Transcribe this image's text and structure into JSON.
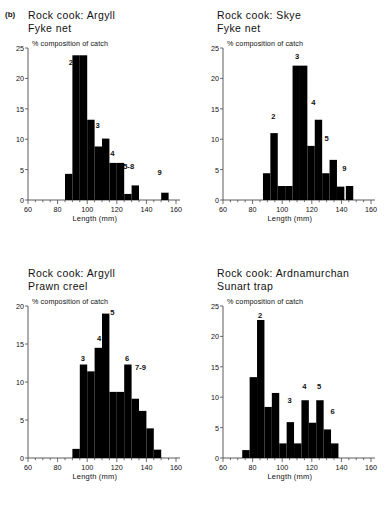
{
  "figure": {
    "panel_tag": "(b)",
    "background": "#ffffff",
    "bar_color": "#000000",
    "axis_color": "#4a4a4a"
  },
  "axis_titles": {
    "y": "% composition of catch",
    "x": "Length (mm)"
  },
  "chart_data": [
    {
      "id": "argyll-fyke-net",
      "type": "bar",
      "title": "Rock cook: Argyll\nFyke net",
      "xlabel": "Length (mm)",
      "ylabel": "% composition of catch",
      "xlim": [
        60,
        160
      ],
      "ylim": [
        0,
        25
      ],
      "xticks": [
        60,
        80,
        100,
        120,
        140,
        160
      ],
      "yticks": [
        0,
        5,
        10,
        15,
        20,
        25
      ],
      "minor_xtick_step": 5,
      "bin_width": 5,
      "grid": false,
      "legend": "none",
      "bin_starts": [
        85,
        90,
        95,
        100,
        105,
        110,
        115,
        120,
        125,
        130,
        150
      ],
      "values": [
        4.3,
        23.8,
        23.8,
        13.2,
        8.8,
        10.1,
        6.1,
        6.1,
        1.0,
        2.4,
        1.2
      ],
      "annotations": [
        {
          "text": "2",
          "x": 89,
          "y": 22.6
        },
        {
          "text": "3",
          "x": 107,
          "y": 12.1
        },
        {
          "text": "4",
          "x": 117,
          "y": 7.6
        },
        {
          "text": "5-8",
          "x": 128,
          "y": 5.4
        },
        {
          "text": "9",
          "x": 149,
          "y": 4.4
        }
      ]
    },
    {
      "id": "skye-fyke-net",
      "type": "bar",
      "title": "Rock cook: Skye\nFyke net",
      "xlabel": "Length (mm)",
      "ylabel": "% composition of catch",
      "xlim": [
        60,
        160
      ],
      "ylim": [
        0,
        25
      ],
      "xticks": [
        60,
        80,
        100,
        120,
        140,
        160
      ],
      "yticks": [
        0,
        5,
        10,
        15,
        20,
        25
      ],
      "minor_xtick_step": 5,
      "bin_width": 5,
      "grid": false,
      "legend": "none",
      "bin_starts": [
        87,
        92,
        97,
        102,
        107,
        112,
        117,
        122,
        127,
        132,
        137,
        143
      ],
      "values": [
        4.4,
        11.0,
        2.3,
        2.3,
        22.1,
        22.1,
        8.9,
        13.2,
        4.4,
        6.6,
        2.2,
        2.3
      ],
      "annotations": [
        {
          "text": "3",
          "x": 110,
          "y": 23.6
        },
        {
          "text": "4",
          "x": 121,
          "y": 16.0
        },
        {
          "text": "2",
          "x": 94,
          "y": 13.6
        },
        {
          "text": "5",
          "x": 130,
          "y": 10.1
        },
        {
          "text": "9",
          "x": 142,
          "y": 5.1
        }
      ]
    },
    {
      "id": "argyll-prawn-creel",
      "type": "bar",
      "title": "Rock cook: Argyll\nPrawn creel",
      "xlabel": "Length (mm)",
      "ylabel": "% composition of catch",
      "xlim": [
        60,
        160
      ],
      "ylim": [
        0,
        20
      ],
      "xticks": [
        60,
        80,
        100,
        120,
        140,
        160
      ],
      "yticks": [
        0,
        5,
        10,
        15,
        20
      ],
      "minor_xtick_step": 5,
      "bin_width": 5,
      "grid": false,
      "legend": "none",
      "bin_starts": [
        90,
        95,
        100,
        105,
        110,
        115,
        120,
        125,
        130,
        135,
        140,
        145
      ],
      "values": [
        1.2,
        12.3,
        11.4,
        14.5,
        19.0,
        8.7,
        8.7,
        12.3,
        7.8,
        6.2,
        3.9,
        1.1
      ],
      "annotations": [
        {
          "text": "5",
          "x": 117,
          "y": 19.1
        },
        {
          "text": "4",
          "x": 108,
          "y": 15.7
        },
        {
          "text": "3",
          "x": 97,
          "y": 13.0
        },
        {
          "text": "6",
          "x": 127,
          "y": 13.0
        },
        {
          "text": "7-9",
          "x": 136,
          "y": 11.9
        }
      ]
    },
    {
      "id": "ardnamurchan-sunart-trap",
      "type": "bar",
      "title": "Rock cook: Ardnamurchan\nSunart trap",
      "xlabel": "Length (mm)",
      "ylabel": "% composition of catch",
      "xlim": [
        60,
        160
      ],
      "ylim": [
        0,
        25
      ],
      "xticks": [
        60,
        80,
        100,
        120,
        140,
        160
      ],
      "yticks": [
        0,
        5,
        10,
        15,
        20,
        25
      ],
      "minor_xtick_step": 5,
      "bin_width": 5,
      "grid": false,
      "legend": "none",
      "bin_starts": [
        73,
        78,
        83,
        88,
        93,
        98,
        103,
        108,
        113,
        118,
        123,
        128,
        133
      ],
      "values": [
        1.3,
        13.3,
        22.7,
        8.4,
        10.7,
        2.4,
        5.9,
        2.4,
        9.5,
        5.8,
        9.5,
        4.7,
        2.4
      ],
      "annotations": [
        {
          "text": "2",
          "x": 85,
          "y": 23.4
        },
        {
          "text": "3",
          "x": 105,
          "y": 9.3
        },
        {
          "text": "4",
          "x": 115,
          "y": 11.6
        },
        {
          "text": "5",
          "x": 125,
          "y": 11.6
        },
        {
          "text": "6",
          "x": 134,
          "y": 7.6
        }
      ]
    }
  ]
}
